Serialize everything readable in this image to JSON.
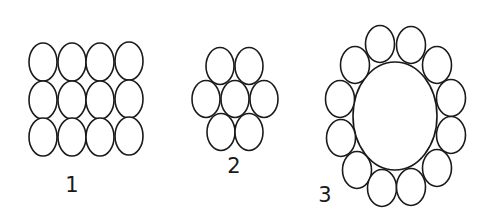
{
  "diagram": {
    "top_rule": {
      "x1": 23,
      "x2": 173,
      "y": 20,
      "color": "#555555"
    },
    "stroke_color": "#1a1a1a",
    "groups": [
      {
        "label": "1",
        "description": "4 x 3 grid of circles",
        "label_pos": [
          72,
          192
        ],
        "circles": [
          [
            43,
            62
          ],
          [
            72,
            62
          ],
          [
            100,
            62
          ],
          [
            129,
            61
          ],
          [
            43,
            100
          ],
          [
            72,
            100
          ],
          [
            100,
            100
          ],
          [
            129,
            99
          ],
          [
            43,
            137
          ],
          [
            72,
            137
          ],
          [
            100,
            137
          ],
          [
            129,
            136
          ]
        ],
        "r": [
          14,
          19
        ]
      },
      {
        "label": "2",
        "description": "7 circles, hexagonal packing",
        "label_pos": [
          234,
          173
        ],
        "circles": [
          [
            220,
            66
          ],
          [
            249,
            66
          ],
          [
            206,
            99
          ],
          [
            235,
            99
          ],
          [
            264,
            99
          ],
          [
            221,
            132
          ],
          [
            249,
            132
          ]
        ],
        "r": [
          14,
          18.5
        ]
      },
      {
        "label": "3",
        "description": "12 small circles ring around one large circle",
        "label_pos": [
          325,
          202
        ],
        "center": {
          "cx": 395,
          "cy": 116,
          "rx": 42,
          "ry": 54
        },
        "circles": [
          [
            380,
            44
          ],
          [
            411,
            45
          ],
          [
            355,
            65
          ],
          [
            437,
            65
          ],
          [
            340,
            99
          ],
          [
            451,
            98
          ],
          [
            341,
            138
          ],
          [
            451,
            135
          ],
          [
            357,
            170
          ],
          [
            437,
            168
          ],
          [
            382,
            188
          ],
          [
            411,
            187
          ]
        ],
        "r": [
          14.5,
          18.5
        ]
      }
    ]
  }
}
